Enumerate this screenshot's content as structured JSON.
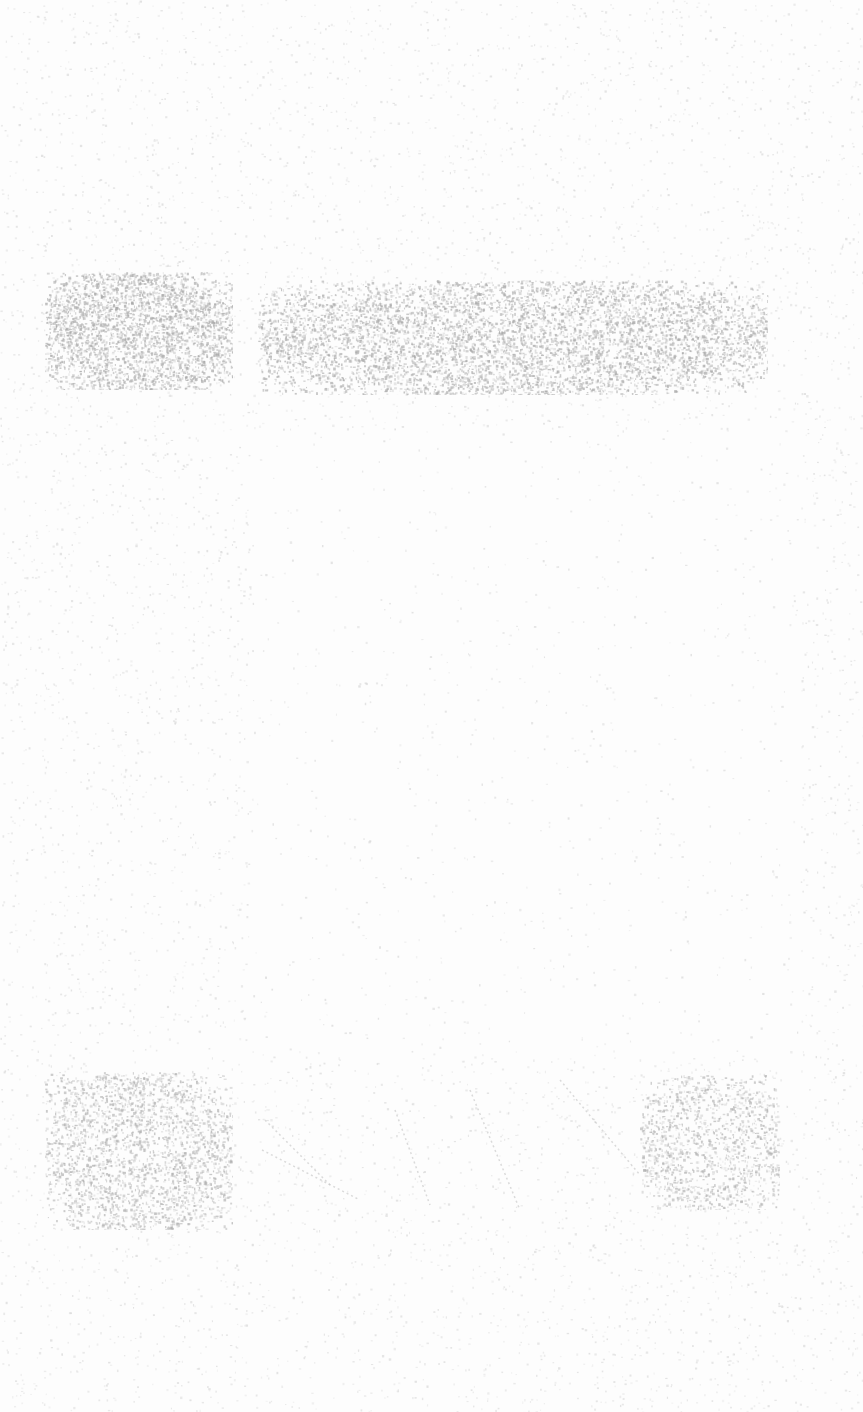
{
  "document": {
    "description": "Faded scanned page; no legible text",
    "background_color": "#fdfdfd",
    "speckle_color": "#b8b8b8"
  },
  "regions": [
    {
      "name": "left-top-block",
      "x": 45,
      "y": 272,
      "w": 188,
      "h": 118,
      "density": 0.42,
      "color": "#a9a9a9"
    },
    {
      "name": "right-top-block",
      "x": 258,
      "y": 280,
      "w": 510,
      "h": 115,
      "density": 0.32,
      "color": "#a9a9a9"
    },
    {
      "name": "left-bottom-block",
      "x": 45,
      "y": 1072,
      "w": 188,
      "h": 158,
      "density": 0.26,
      "color": "#b0b0b0"
    },
    {
      "name": "right-bottom-patch",
      "x": 640,
      "y": 1075,
      "w": 140,
      "h": 135,
      "density": 0.22,
      "color": "#b0b0b0"
    }
  ],
  "strokes": {
    "color": "#c4c4c4",
    "lines": [
      [
        262,
        1150,
        360,
        1200
      ],
      [
        265,
        1120,
        330,
        1185
      ],
      [
        395,
        1110,
        430,
        1205
      ],
      [
        470,
        1090,
        520,
        1210
      ],
      [
        560,
        1080,
        640,
        1175
      ]
    ]
  }
}
